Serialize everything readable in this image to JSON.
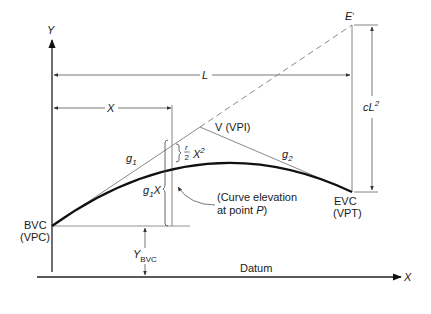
{
  "diagram": {
    "axes": {
      "y_label": "Y",
      "x_label": "X",
      "datum_label": "Datum"
    },
    "points": {
      "bvc": {
        "line1": "BVC",
        "line2": "(VPC)"
      },
      "evc": {
        "line1": "EVC",
        "line2": "(VPT)"
      },
      "vpi": {
        "label": "V (VPI)"
      },
      "e_prime": {
        "label": "E",
        "prime": "′"
      }
    },
    "dimensions": {
      "length": "L",
      "distance_x": "X",
      "offset_cl2": {
        "base": "cL",
        "exp": "2"
      },
      "y_bvc": {
        "base": "Y",
        "sub": "BVC"
      },
      "g1x": {
        "base": "g",
        "sub": "1",
        "tail": "X"
      },
      "r2x2": {
        "num": "r",
        "den": "2",
        "base": "X",
        "exp": "2"
      }
    },
    "grades": {
      "g1": {
        "base": "g",
        "sub": "1"
      },
      "g2": {
        "base": "g",
        "sub": "2"
      }
    },
    "annotation": {
      "line1": "(Curve elevation",
      "line2_prefix": "at point ",
      "line2_point": "P",
      "line2_suffix": ")"
    },
    "colors": {
      "curve": "#111111",
      "tangent": "#8a8a8a",
      "dimension": "#555555",
      "axis": "#222222",
      "text": "#1a1a1a"
    }
  }
}
